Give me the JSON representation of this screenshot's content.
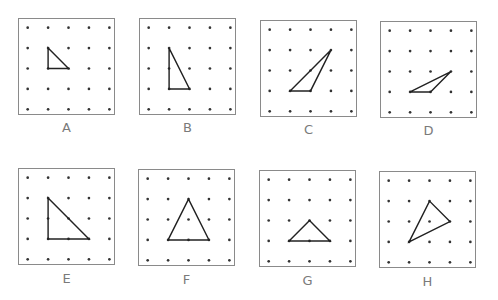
{
  "figure": {
    "grid": {
      "rows": 5,
      "cols": 5
    },
    "colors": {
      "border": "#8a8a8a",
      "dot": "#333333",
      "triangle_stroke": "#222222",
      "label": "#7a7a7a"
    },
    "boards": [
      {
        "label": "A",
        "triangle": [
          [
            1,
            1
          ],
          [
            1,
            2
          ],
          [
            2,
            2
          ]
        ]
      },
      {
        "label": "B",
        "triangle": [
          [
            1,
            1
          ],
          [
            1,
            3
          ],
          [
            2,
            3
          ]
        ]
      },
      {
        "label": "C",
        "triangle": [
          [
            1,
            3
          ],
          [
            2,
            3
          ],
          [
            3,
            1
          ]
        ]
      },
      {
        "label": "D",
        "triangle": [
          [
            1,
            3
          ],
          [
            2,
            3
          ],
          [
            3,
            2
          ]
        ]
      },
      {
        "label": "E",
        "triangle": [
          [
            1,
            1
          ],
          [
            1,
            3
          ],
          [
            3,
            3
          ]
        ]
      },
      {
        "label": "F",
        "triangle": [
          [
            1,
            3
          ],
          [
            2,
            1
          ],
          [
            3,
            3
          ]
        ]
      },
      {
        "label": "G",
        "triangle": [
          [
            1,
            3
          ],
          [
            2,
            2
          ],
          [
            3,
            3
          ]
        ]
      },
      {
        "label": "H",
        "triangle": [
          [
            1,
            3
          ],
          [
            2,
            1
          ],
          [
            3,
            2
          ]
        ]
      }
    ]
  }
}
